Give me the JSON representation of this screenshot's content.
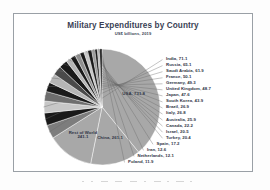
{
  "chart": {
    "title": "Military Expenditures by Country",
    "subtitle": "US$ billions, 2019"
  },
  "chart_data": {
    "type": "pie",
    "title": "Military Expenditures by Country",
    "subtitle": "US$ billions, 2019",
    "unit": "US$ billions",
    "year": "2019",
    "xlabel": "",
    "ylabel": "",
    "grid": false,
    "legend": "none",
    "label_format": "{name}, {value}",
    "start_angle_deg": -90,
    "direction": "clockwise",
    "categories": [
      "USA",
      "China",
      "Rest of World",
      "India",
      "Russia",
      "Saudi Arabia",
      "France",
      "Germany",
      "United Kingdom",
      "Japan",
      "South Korea",
      "Brazil",
      "Italy",
      "Australia",
      "Canada",
      "Israel",
      "Turkey",
      "Spain",
      "Iran",
      "Netherlands",
      "Poland"
    ],
    "values": [
      731.8,
      261.1,
      241.1,
      71.1,
      65.1,
      61.9,
      50.1,
      49.3,
      48.7,
      47.6,
      43.9,
      26.9,
      26.8,
      25.9,
      22.2,
      20.5,
      20.4,
      17.2,
      12.6,
      12.1,
      11.9
    ],
    "slices": [
      {
        "name": "USA",
        "value": 731.8,
        "label": "USA, 731.8",
        "color": "#a8a8a8",
        "label_placement": "inside"
      },
      {
        "name": "China",
        "value": 261.1,
        "label": "China, 261.1",
        "color": "#a8a8a8",
        "label_placement": "inside"
      },
      {
        "name": "Rest of World",
        "value": 241.1,
        "label": "Rest of World\n241.1",
        "color": "#a8a8a8",
        "label_placement": "inside"
      },
      {
        "name": "India",
        "value": 71.1,
        "label": "India, 71.1",
        "color": "#7d7d7d",
        "label_placement": "leader"
      },
      {
        "name": "Russia",
        "value": 65.1,
        "label": "Russia, 65.1",
        "color": "#1a1a1a",
        "label_placement": "leader"
      },
      {
        "name": "Saudi Arabia",
        "value": 61.9,
        "label": "Saudi Arabia, 61.9",
        "color": "#c7c7c7",
        "label_placement": "leader"
      },
      {
        "name": "France",
        "value": 50.1,
        "label": "France, 50.1",
        "color": "#6e6e6e",
        "label_placement": "leader"
      },
      {
        "name": "Germany",
        "value": 49.3,
        "label": "Germany, 49.3",
        "color": "#1a1a1a",
        "label_placement": "leader"
      },
      {
        "name": "United Kingdom",
        "value": 48.7,
        "label": "United Kingdom, 48.7",
        "color": "#b5b5b5",
        "label_placement": "leader"
      },
      {
        "name": "Japan",
        "value": 47.6,
        "label": "Japan, 47.6",
        "color": "#4a4a4a",
        "label_placement": "leader"
      },
      {
        "name": "South Korea",
        "value": 43.9,
        "label": "South Korea, 43.9",
        "color": "#1a1a1a",
        "label_placement": "leader"
      },
      {
        "name": "Brazil",
        "value": 26.9,
        "label": "Brazil, 26.9",
        "color": "#b5b5b5",
        "label_placement": "leader"
      },
      {
        "name": "Italy",
        "value": 26.8,
        "label": "Italy, 26.8",
        "color": "#1a1a1a",
        "label_placement": "leader"
      },
      {
        "name": "Australia",
        "value": 25.9,
        "label": "Australia, 25.9",
        "color": "#8f8f8f",
        "label_placement": "leader"
      },
      {
        "name": "Canada",
        "value": 22.2,
        "label": "Canada, 22.2",
        "color": "#1a1a1a",
        "label_placement": "leader"
      },
      {
        "name": "Israel",
        "value": 20.5,
        "label": "Israel, 20.5",
        "color": "#c7c7c7",
        "label_placement": "leader"
      },
      {
        "name": "Turkey",
        "value": 20.4,
        "label": "Turkey, 20.4",
        "color": "#1a1a1a",
        "label_placement": "leader"
      },
      {
        "name": "Spain",
        "value": 17.2,
        "label": "Spain, 17.2",
        "color": "#9d9d9d",
        "label_placement": "leader"
      },
      {
        "name": "Iran",
        "value": 12.6,
        "label": "Iran, 12.6",
        "color": "#1a1a1a",
        "label_placement": "leader"
      },
      {
        "name": "Netherlands",
        "value": 12.1,
        "label": "Netherlands, 12.1",
        "color": "#bdbdbd",
        "label_placement": "leader"
      },
      {
        "name": "Poland",
        "value": 11.9,
        "label": "Poland, 11.9",
        "color": "#1a1a1a",
        "label_placement": "leader"
      }
    ]
  },
  "style": {
    "frame_border_color": "#9aa0a6",
    "title_color": "#3a3f55",
    "label_color": "#2f3445",
    "leader_color": "#6b6b6b",
    "plot_background": "#ffffff"
  }
}
